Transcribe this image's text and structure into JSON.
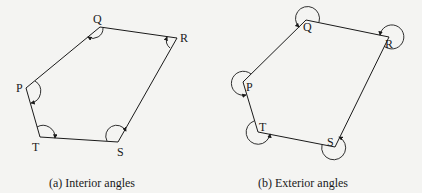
{
  "figure": {
    "panels": [
      {
        "id": "a",
        "caption": "(a) Interior angles",
        "vertices": {
          "P": [
            26,
            88
          ],
          "Q": [
            100,
            27
          ],
          "R": [
            177,
            38
          ],
          "S": [
            118,
            142
          ],
          "T": [
            40,
            137
          ]
        },
        "labels": {
          "P": "P",
          "Q": "Q",
          "R": "R",
          "S": "S",
          "T": "T"
        }
      },
      {
        "id": "b",
        "caption": "(b) Exterior angles",
        "vertices": {
          "P": [
            243,
            82
          ],
          "Q": [
            306,
            20
          ],
          "R": [
            389,
            37
          ],
          "S": [
            335,
            147
          ],
          "T": [
            258,
            132
          ]
        },
        "labels": {
          "P": "P",
          "Q": "Q",
          "R": "R",
          "S": "S",
          "T": "T"
        }
      }
    ],
    "colors": {
      "line": "#1a1a1a",
      "background": "#f4f4f2"
    }
  }
}
